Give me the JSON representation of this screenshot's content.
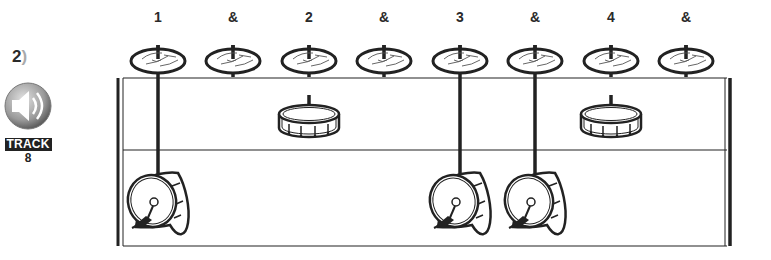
{
  "exercise": {
    "number": "2",
    "paren": ")"
  },
  "track": {
    "label": "TRACK",
    "number": "8",
    "icon": "speaker-icon"
  },
  "counts": [
    {
      "label": "1",
      "x": 158
    },
    {
      "label": "&",
      "x": 233
    },
    {
      "label": "2",
      "x": 309
    },
    {
      "label": "&",
      "x": 384
    },
    {
      "label": "3",
      "x": 460
    },
    {
      "label": "&",
      "x": 535
    },
    {
      "label": "4",
      "x": 611
    },
    {
      "label": "&",
      "x": 686
    }
  ],
  "rows": {
    "hihat": {
      "icon": "cymbal-icon",
      "hits": [
        1,
        1,
        1,
        1,
        1,
        1,
        1,
        1
      ]
    },
    "snare": {
      "icon": "snare-drum-icon",
      "hits": [
        0,
        0,
        1,
        0,
        0,
        0,
        1,
        0
      ]
    },
    "bass": {
      "icon": "bass-drum-icon",
      "hits": [
        1,
        0,
        0,
        0,
        1,
        1,
        0,
        0
      ]
    }
  },
  "colors": {
    "ink": "#222222",
    "track_bg": "#222222",
    "speaker_gradient_light": "#d8d8d8",
    "speaker_gradient_dark": "#6a6a6a"
  }
}
